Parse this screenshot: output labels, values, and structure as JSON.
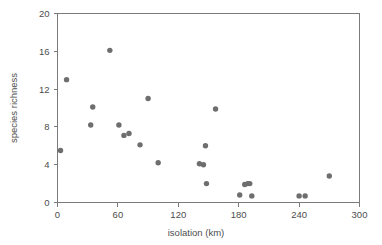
{
  "chart_data": {
    "type": "scatter",
    "title": "",
    "xlabel": "isolation (km)",
    "ylabel": "species richness",
    "xlim": [
      0,
      300
    ],
    "ylim": [
      0,
      20
    ],
    "xticks": [
      0,
      60,
      120,
      180,
      240,
      300
    ],
    "yticks": [
      0,
      4,
      8,
      12,
      16,
      20
    ],
    "xtick_labels": [
      "0",
      "60",
      "120",
      "180",
      "240",
      "300"
    ],
    "ytick_labels": [
      "0",
      "4",
      "8",
      "12",
      "16",
      "20"
    ],
    "grid": false,
    "legend": false,
    "marker_color": "#6e6e6e",
    "frame_color": "#7a7a7a",
    "series": [
      {
        "name": "islands",
        "points": [
          {
            "x": 3,
            "y": 5.5
          },
          {
            "x": 9,
            "y": 13.0
          },
          {
            "x": 33,
            "y": 8.2
          },
          {
            "x": 35,
            "y": 10.1
          },
          {
            "x": 52,
            "y": 16.1
          },
          {
            "x": 61,
            "y": 8.2
          },
          {
            "x": 66,
            "y": 7.1
          },
          {
            "x": 71,
            "y": 7.3
          },
          {
            "x": 82,
            "y": 6.1
          },
          {
            "x": 90,
            "y": 11.0
          },
          {
            "x": 100,
            "y": 4.2
          },
          {
            "x": 141,
            "y": 4.1
          },
          {
            "x": 145,
            "y": 4.0
          },
          {
            "x": 147,
            "y": 6.0
          },
          {
            "x": 148,
            "y": 2.0
          },
          {
            "x": 157,
            "y": 9.9
          },
          {
            "x": 181,
            "y": 0.8
          },
          {
            "x": 186,
            "y": 1.9
          },
          {
            "x": 189,
            "y": 2.0
          },
          {
            "x": 191,
            "y": 2.0
          },
          {
            "x": 193,
            "y": 0.7
          },
          {
            "x": 240,
            "y": 0.7
          },
          {
            "x": 246,
            "y": 0.7
          },
          {
            "x": 270,
            "y": 2.8
          }
        ]
      }
    ]
  },
  "axes": {
    "x_title": "isolation (km)",
    "y_title": "species richness"
  }
}
